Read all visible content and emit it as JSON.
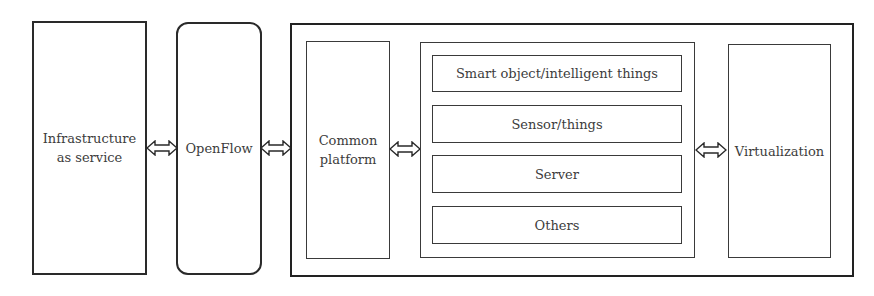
{
  "diagram": {
    "infrastructure": {
      "label": "Infrastructure\nas service"
    },
    "openflow": {
      "label": "OpenFlow"
    },
    "common_platform": {
      "label": "Common\nplatform"
    },
    "items": [
      {
        "label": "Smart object/intelligent things"
      },
      {
        "label": "Sensor/things"
      },
      {
        "label": "Server"
      },
      {
        "label": "Others"
      }
    ],
    "virtualization": {
      "label": "Virtualization"
    },
    "arrows": [
      {
        "from": "Infrastructure as service",
        "to": "OpenFlow",
        "type": "bidirectional"
      },
      {
        "from": "OpenFlow",
        "to": "Outer platform",
        "type": "bidirectional"
      },
      {
        "from": "Common platform",
        "to": "Items group",
        "type": "bidirectional"
      },
      {
        "from": "Items group",
        "to": "Virtualization",
        "type": "bidirectional"
      }
    ]
  }
}
